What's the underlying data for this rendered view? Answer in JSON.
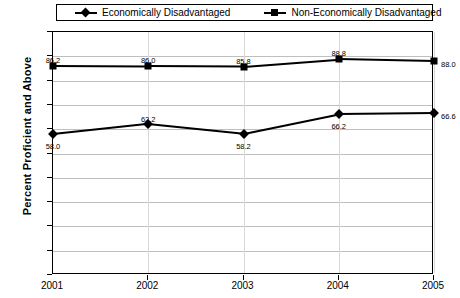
{
  "chart_data": {
    "type": "line",
    "title": "",
    "xlabel": "",
    "ylabel": "Percent Proficient and Above",
    "categories": [
      "2001",
      "2002",
      "2003",
      "2004",
      "2005"
    ],
    "ylim": [
      0,
      100
    ],
    "ytick_step": 10,
    "yticks": [
      "0",
      "10",
      "20",
      "30",
      "40",
      "50",
      "60",
      "70",
      "80",
      "90",
      "100"
    ],
    "grid": true,
    "legend_position": "top",
    "series": [
      {
        "name": "Economically Disadvantaged",
        "marker": "diamond",
        "color": "#000000",
        "values": [
          58.0,
          62.2,
          58.2,
          66.2,
          66.6
        ],
        "labels": [
          "58.0",
          "62.2",
          "58.2",
          "66.2",
          "66.6"
        ]
      },
      {
        "name": "Non-Economically Disadvantaged",
        "marker": "square",
        "color": "#000000",
        "values": [
          86.2,
          86.0,
          85.8,
          88.8,
          88.0
        ],
        "labels": [
          "86.2",
          "86.0",
          "85.8",
          "88.8",
          "88.0"
        ]
      }
    ]
  },
  "legend": {
    "items": [
      {
        "label": "Economically Disadvantaged",
        "marker": "diamond"
      },
      {
        "label": "Non-Economically Disadvantaged",
        "marker": "square"
      }
    ]
  }
}
